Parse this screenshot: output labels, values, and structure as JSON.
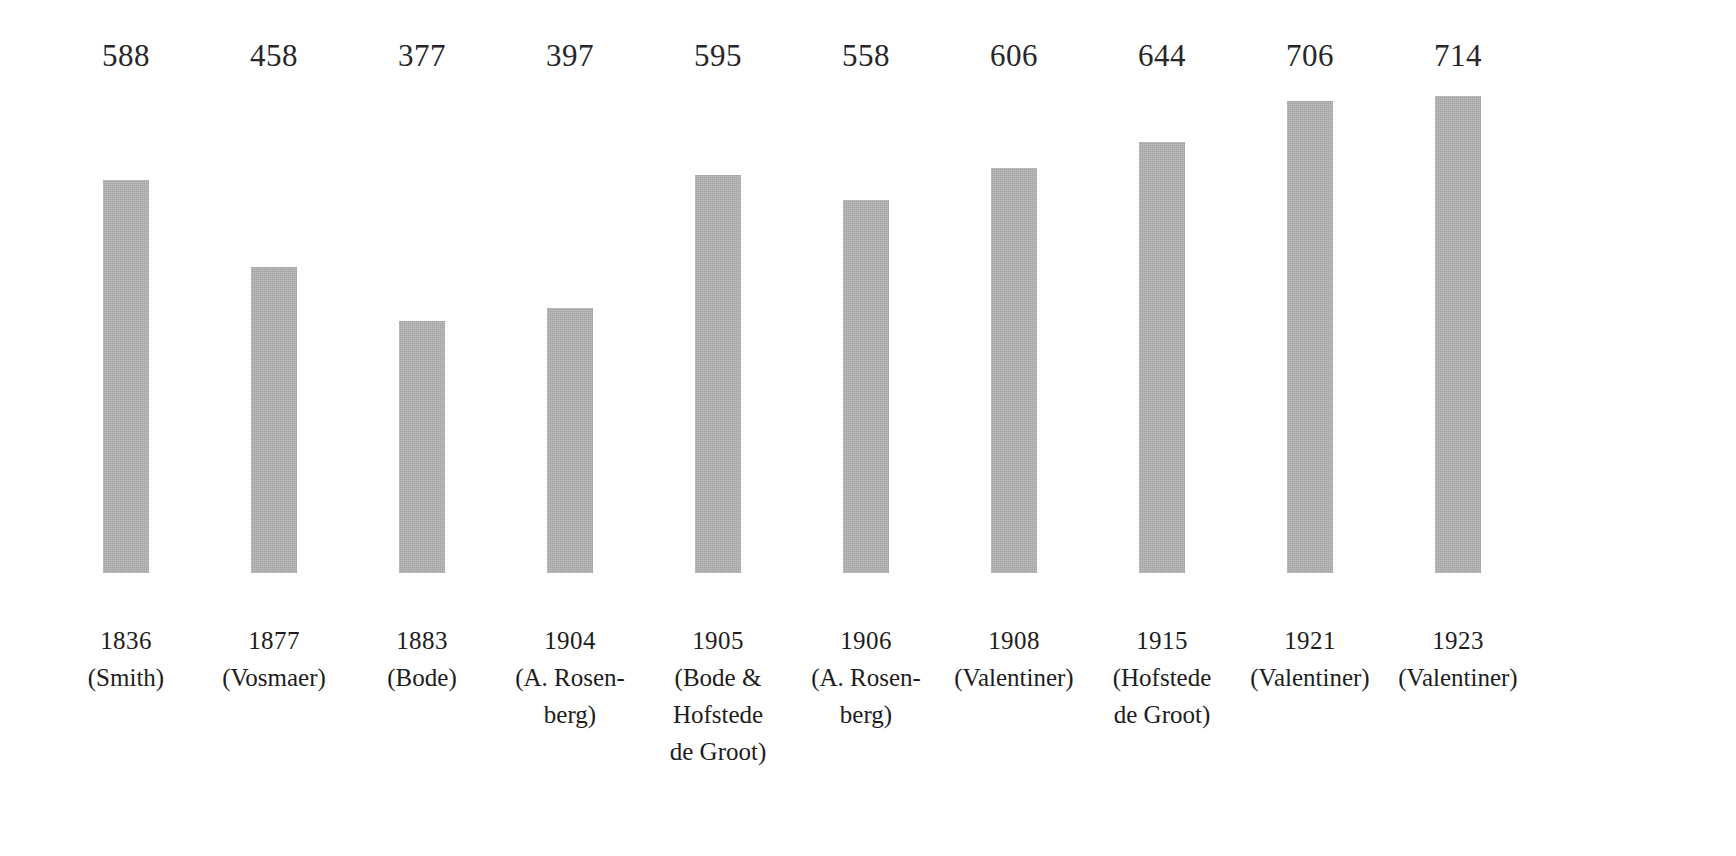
{
  "chart_data": {
    "type": "bar",
    "title": "",
    "subtitle": "",
    "xlabel": "",
    "ylabel": "",
    "ylim": [
      0,
      800
    ],
    "grid": false,
    "legend": null,
    "bar_color": "#a3a3a3",
    "background_color": "#ffffff",
    "value_labels_shown": true,
    "categories": [
      "1836 (Smith)",
      "1877 (Vosmaer)",
      "1883 (Bode)",
      "1904 (A. Rosenberg)",
      "1905 (Bode & Hofstede de Groot)",
      "1906 (A. Rosenberg)",
      "1908 (Valentiner)",
      "1915 (Hofstede de Groot)",
      "1921 (Valentiner)",
      "1923 (Valentiner)"
    ],
    "values": [
      588,
      458,
      377,
      397,
      595,
      558,
      606,
      644,
      706,
      714
    ],
    "bars": [
      {
        "value_label": "588",
        "value": 588,
        "year": "1836",
        "label_lines": [
          "1836",
          "(Smith)"
        ]
      },
      {
        "value_label": "458",
        "value": 458,
        "year": "1877",
        "label_lines": [
          "1877",
          "(Vosmaer)"
        ]
      },
      {
        "value_label": "377",
        "value": 377,
        "year": "1883",
        "label_lines": [
          "1883",
          "(Bode)"
        ]
      },
      {
        "value_label": "397",
        "value": 397,
        "year": "1904",
        "label_lines": [
          "1904",
          "(A. Rosen-",
          "berg)"
        ]
      },
      {
        "value_label": "595",
        "value": 595,
        "year": "1905",
        "label_lines": [
          "1905",
          "(Bode &",
          "Hofstede",
          "de Groot)"
        ]
      },
      {
        "value_label": "558",
        "value": 558,
        "year": "1906",
        "label_lines": [
          "1906",
          "(A. Rosen-",
          "berg)"
        ]
      },
      {
        "value_label": "606",
        "value": 606,
        "year": "1908",
        "label_lines": [
          "1908",
          "(Valentiner)"
        ]
      },
      {
        "value_label": "644",
        "value": 644,
        "year": "1915",
        "label_lines": [
          "1915",
          "(Hofstede",
          "de Groot)"
        ]
      },
      {
        "value_label": "706",
        "value": 706,
        "year": "1921",
        "label_lines": [
          "1921",
          "(Valentiner)"
        ]
      },
      {
        "value_label": "714",
        "value": 714,
        "year": "1923",
        "label_lines": [
          "1923",
          "(Valentiner)"
        ]
      }
    ]
  },
  "layout": {
    "baseline_y": 573,
    "first_bar_center_x": 126,
    "column_pitch": 148,
    "bar_width": 46,
    "px_per_unit": 0.6685
  }
}
